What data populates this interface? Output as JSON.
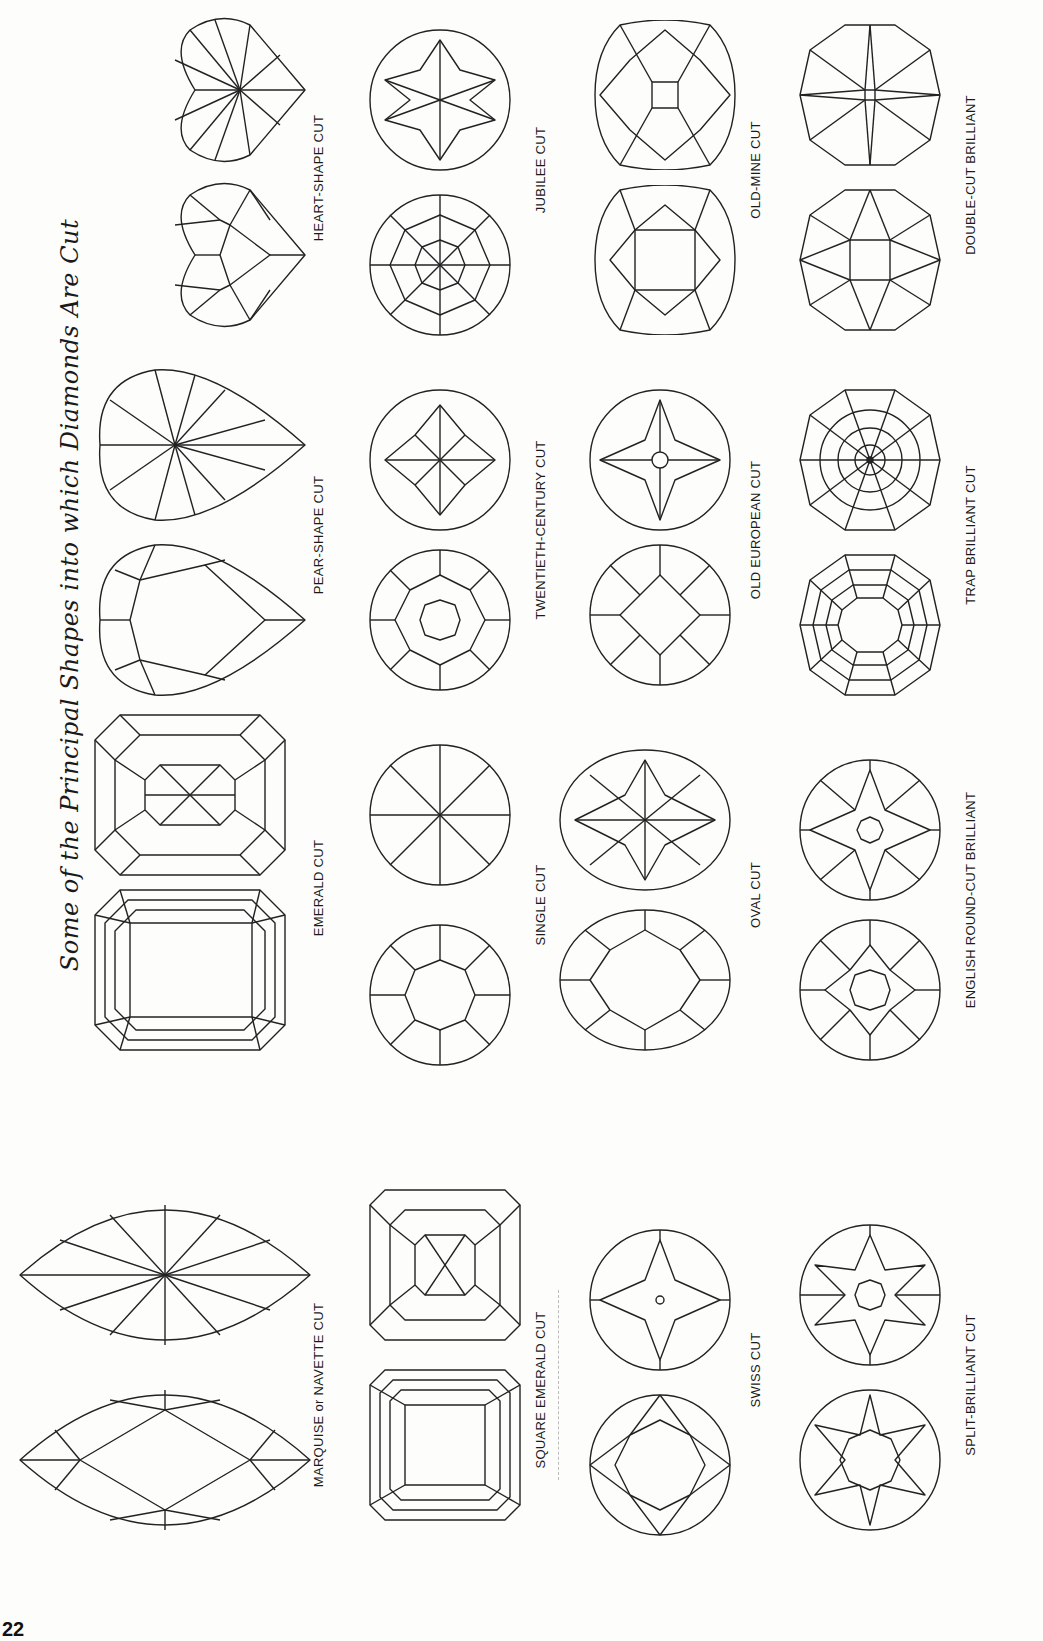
{
  "page": {
    "title": "Some of the Principal Shapes into which Diamonds Are Cut",
    "page_number": "22",
    "orientation": "rotated-90-ccw"
  },
  "cuts": [
    {
      "id": "heart-shape",
      "label": "HEART-SHAPE CUT",
      "views": [
        "pavilion",
        "crown"
      ]
    },
    {
      "id": "jubilee",
      "label": "JUBILEE CUT",
      "views": [
        "crown",
        "pavilion"
      ]
    },
    {
      "id": "old-mine",
      "label": "OLD-MINE CUT",
      "views": [
        "crown",
        "pavilion"
      ]
    },
    {
      "id": "double-cut-brilliant",
      "label": "DOUBLE-CUT BRILLIANT",
      "views": [
        "crown",
        "pavilion"
      ]
    },
    {
      "id": "pear-shape",
      "label": "PEAR-SHAPE CUT",
      "views": [
        "crown",
        "pavilion"
      ]
    },
    {
      "id": "twentieth-century",
      "label": "TWENTIETH-CENTURY CUT",
      "views": [
        "crown",
        "pavilion"
      ]
    },
    {
      "id": "old-european",
      "label": "OLD EUROPEAN CUT",
      "views": [
        "crown",
        "pavilion"
      ]
    },
    {
      "id": "trap-brilliant",
      "label": "TRAP BRILLIANT CUT",
      "views": [
        "crown",
        "pavilion"
      ]
    },
    {
      "id": "emerald",
      "label": "EMERALD CUT",
      "views": [
        "crown",
        "pavilion"
      ]
    },
    {
      "id": "single",
      "label": "SINGLE CUT",
      "views": [
        "crown",
        "pavilion"
      ]
    },
    {
      "id": "oval",
      "label": "OVAL CUT",
      "views": [
        "crown",
        "pavilion"
      ]
    },
    {
      "id": "english-round-cut-brilliant",
      "label": "ENGLISH ROUND-CUT BRILLIANT",
      "views": [
        "crown",
        "pavilion"
      ]
    },
    {
      "id": "marquise-navette",
      "label": "MARQUISE or NAVETTE CUT",
      "views": [
        "crown",
        "pavilion"
      ]
    },
    {
      "id": "square-emerald",
      "label": "SQUARE EMERALD CUT",
      "views": [
        "crown",
        "pavilion"
      ]
    },
    {
      "id": "swiss",
      "label": "SWISS CUT",
      "views": [
        "crown",
        "pavilion"
      ]
    },
    {
      "id": "split-brilliant",
      "label": "SPLIT-BRILLIANT CUT",
      "views": [
        "crown",
        "pavilion"
      ]
    }
  ]
}
